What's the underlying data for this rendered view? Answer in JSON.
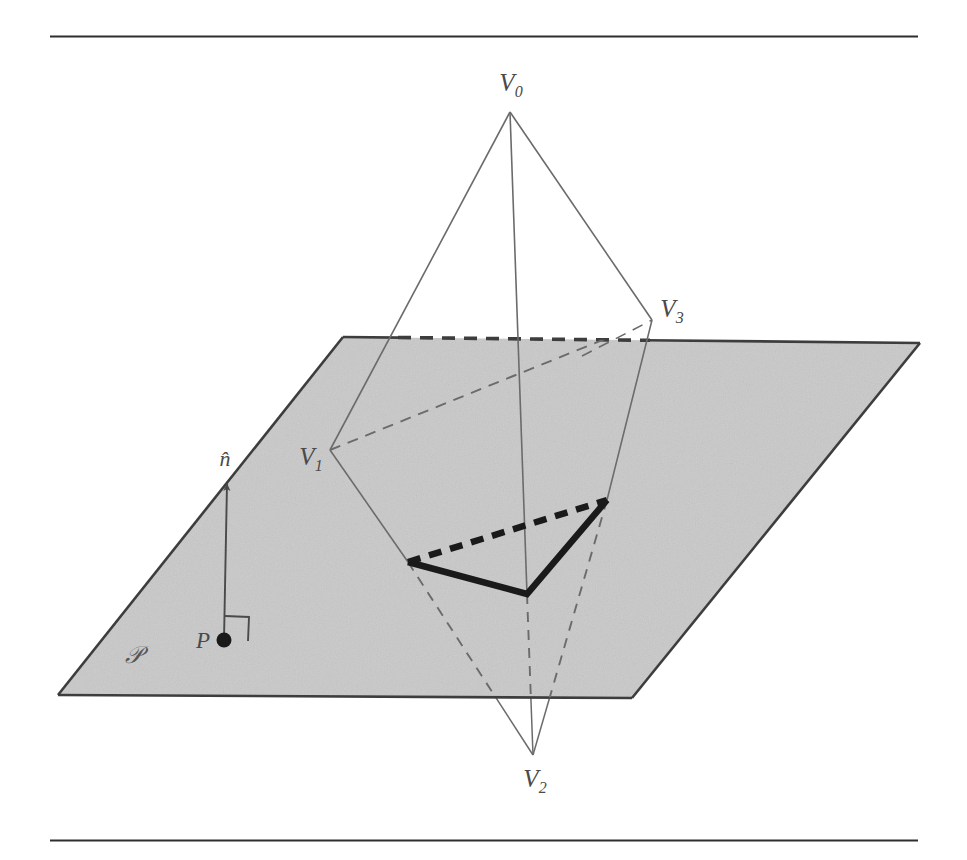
{
  "figure": {
    "caption_rules": {
      "top_rule": {
        "y": 36,
        "x_start": 50,
        "x_end": 918
      },
      "bottom_rule": {
        "y": 840,
        "x_start": 50,
        "x_end": 918
      }
    },
    "colors": {
      "plane_fill": "#c9c9c9",
      "plane_edge": "#3d3d3d",
      "thin_edge": "#6b6b6b",
      "hidden_edge": "#6b6b6b",
      "bold_intersection": "#1a1a1a",
      "label_color": "#4a4a4a",
      "background": "#ffffff"
    },
    "plane": {
      "name": "plane-P",
      "label": "𝒫",
      "label_pos": {
        "x": 133,
        "y": 655
      },
      "corners": [
        {
          "x": 343,
          "y": 337
        },
        {
          "x": 920,
          "y": 343
        },
        {
          "x": 632,
          "y": 698
        },
        {
          "x": 58,
          "y": 695
        }
      ],
      "occluded_top_edge": {
        "x_start": 400,
        "x_end": 645
      }
    },
    "normal": {
      "label": "n̂",
      "label_pos": {
        "x": 225,
        "y": 459
      },
      "tail": {
        "x": 224,
        "y": 640
      },
      "tip": {
        "x": 227,
        "y": 478
      },
      "right_angle_marker": {
        "x": 224,
        "y": 640,
        "size": 24
      }
    },
    "point_p": {
      "label": "P",
      "label_pos": {
        "x": 203,
        "y": 641
      },
      "dot": {
        "x": 224,
        "y": 640,
        "r": 7
      }
    },
    "tetrahedron": {
      "vertices": [
        {
          "id": "V0",
          "letter": "V",
          "subscript": "0",
          "x": 510,
          "y": 112,
          "label_x": 511,
          "label_y": 85
        },
        {
          "id": "V1",
          "letter": "V",
          "subscript": "1",
          "x": 330,
          "y": 450,
          "label_x": 311,
          "label_y": 459
        },
        {
          "id": "V2",
          "letter": "V",
          "subscript": "2",
          "x": 533,
          "y": 755,
          "label_x": 535,
          "label_y": 781
        },
        {
          "id": "V3",
          "letter": "V",
          "subscript": "3",
          "x": 652,
          "y": 320,
          "label_x": 672,
          "label_y": 311
        }
      ],
      "edges": [
        {
          "from": "V0",
          "to": "V1",
          "style": "solid-thin"
        },
        {
          "from": "V0",
          "to": "V2",
          "style": "solid-thin-then-hidden"
        },
        {
          "from": "V0",
          "to": "V3",
          "style": "solid-thin"
        },
        {
          "from": "V1",
          "to": "V3",
          "style": "dashed-hidden"
        },
        {
          "from": "V1",
          "to": "V2",
          "style": "solid-then-hidden"
        },
        {
          "from": "V3",
          "to": "V2",
          "style": "solid-then-hidden"
        }
      ]
    },
    "intersection_polygon": {
      "name": "plane-tetrahedron-intersection",
      "points": [
        {
          "x": 408,
          "y": 562
        },
        {
          "x": 527,
          "y": 594
        },
        {
          "x": 607,
          "y": 500
        }
      ],
      "solid_segments": [
        {
          "from": 0,
          "to": 1
        },
        {
          "from": 1,
          "to": 2
        }
      ],
      "dashed_segments": [
        {
          "from": 2,
          "to": 0
        }
      ],
      "stroke_width": 6
    }
  }
}
